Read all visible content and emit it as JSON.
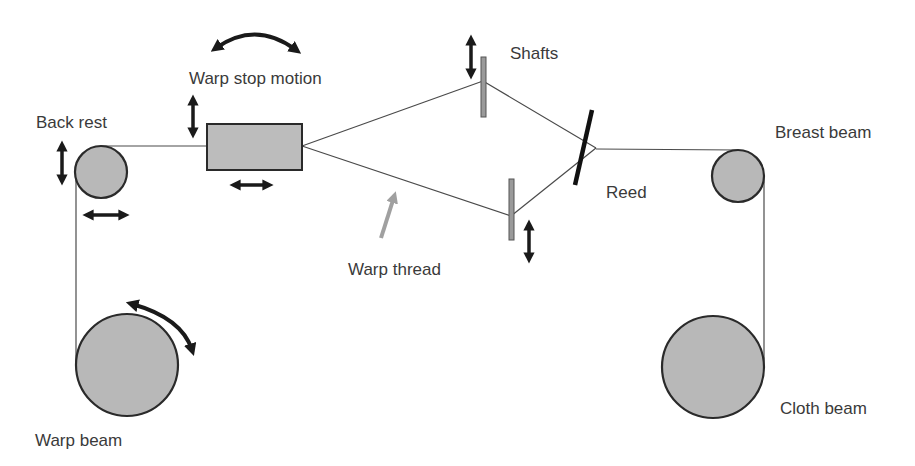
{
  "diagram": {
    "type": "loom warp path schematic",
    "labels": {
      "back_rest": "Back rest",
      "warp_stop_motion": "Warp stop motion",
      "shafts": "Shafts",
      "reed": "Reed",
      "breast_beam": "Breast beam",
      "warp_thread": "Warp thread",
      "warp_beam": "Warp beam",
      "cloth_beam": "Cloth beam"
    },
    "components": [
      {
        "id": "back-rest",
        "shape": "circle",
        "motion": [
          "vertical",
          "horizontal"
        ]
      },
      {
        "id": "warp-stop-motion",
        "shape": "rectangle",
        "motion": [
          "vertical",
          "horizontal",
          "rocking"
        ]
      },
      {
        "id": "upper-shaft",
        "shape": "bar",
        "motion": [
          "vertical"
        ]
      },
      {
        "id": "lower-shaft",
        "shape": "bar",
        "motion": [
          "vertical"
        ]
      },
      {
        "id": "reed",
        "shape": "slanted-bar"
      },
      {
        "id": "breast-beam",
        "shape": "circle"
      },
      {
        "id": "warp-beam",
        "shape": "circle",
        "motion": [
          "rotation"
        ]
      },
      {
        "id": "cloth-beam",
        "shape": "circle"
      }
    ],
    "colors": {
      "roller_fill": "#b8b8b8",
      "outline": "#2a2a2a",
      "arrow": "#1a1a1a",
      "pointer_arrow": "#a0a0a0",
      "text": "#3a3a3a"
    }
  }
}
